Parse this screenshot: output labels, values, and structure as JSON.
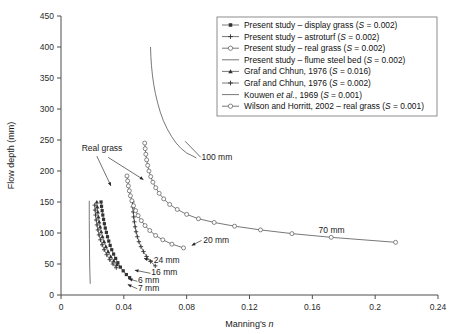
{
  "chart_data": {
    "type": "line",
    "title": "",
    "xlabel": "Manning's n",
    "ylabel": "Flow depth (mm)",
    "xlim": [
      0,
      0.24
    ],
    "ylim": [
      0,
      450
    ],
    "xticks": [
      "0",
      "0.04",
      "0.08",
      "0.12",
      "0.16",
      "0.2",
      "0.24"
    ],
    "xtick_values": [
      0,
      0.04,
      0.08,
      0.12,
      0.16,
      0.2,
      0.24
    ],
    "yticks": [
      "0",
      "50",
      "100",
      "150",
      "200",
      "250",
      "300",
      "350",
      "400",
      "450"
    ],
    "ytick_values": [
      0,
      50,
      100,
      150,
      200,
      250,
      300,
      350,
      400,
      450
    ],
    "grid": false,
    "legend_position": "top-right",
    "series": [
      {
        "name": "Present study – display grass (S = 0.002)",
        "marker": "filled-square",
        "label_key": "display-grass",
        "points": [
          [
            0.0255,
            150
          ],
          [
            0.0258,
            143
          ],
          [
            0.0262,
            136
          ],
          [
            0.0266,
            129
          ],
          [
            0.0271,
            122
          ],
          [
            0.0276,
            115
          ],
          [
            0.0282,
            108
          ],
          [
            0.0289,
            101
          ],
          [
            0.0296,
            94
          ],
          [
            0.0304,
            87
          ],
          [
            0.0313,
            80
          ],
          [
            0.0323,
            73
          ],
          [
            0.0335,
            66
          ],
          [
            0.0348,
            59
          ],
          [
            0.0362,
            52
          ],
          [
            0.0378,
            45
          ],
          [
            0.0396,
            39
          ],
          [
            0.0416,
            33
          ],
          [
            0.0437,
            28
          ]
        ]
      },
      {
        "name": "Present study – astroturf (S = 0.002)",
        "marker": "plus",
        "label_key": "astroturf",
        "points": [
          [
            0.0455,
            150
          ],
          [
            0.0457,
            142
          ],
          [
            0.046,
            134
          ],
          [
            0.0463,
            126
          ],
          [
            0.0467,
            118
          ],
          [
            0.0472,
            110
          ],
          [
            0.0478,
            102
          ],
          [
            0.0486,
            94
          ],
          [
            0.0496,
            86
          ],
          [
            0.0509,
            78
          ],
          [
            0.0525,
            70
          ],
          [
            0.0545,
            62
          ],
          [
            0.057,
            54
          ],
          [
            0.06,
            47
          ]
        ]
      },
      {
        "name": "Present study – real grass (S = 0.002)",
        "marker": "open-circle",
        "label_key": "real-grass-present",
        "points": [
          [
            0.042,
            192
          ],
          [
            0.0424,
            184
          ],
          [
            0.0429,
            176
          ],
          [
            0.0435,
            168
          ],
          [
            0.0442,
            160
          ],
          [
            0.0451,
            152
          ],
          [
            0.0462,
            144
          ],
          [
            0.0475,
            136
          ],
          [
            0.0491,
            128
          ],
          [
            0.0511,
            120
          ],
          [
            0.0535,
            112
          ],
          [
            0.0565,
            104
          ],
          [
            0.0602,
            96
          ],
          [
            0.0648,
            89
          ],
          [
            0.0706,
            82
          ],
          [
            0.078,
            76
          ]
        ]
      },
      {
        "name": "Present study – flume steel bed (S = 0.002)",
        "marker": "line",
        "label_key": "steel-bed-100mm",
        "points": [
          [
            0.057,
            400
          ],
          [
            0.0572,
            385
          ],
          [
            0.0576,
            370
          ],
          [
            0.0582,
            355
          ],
          [
            0.059,
            340
          ],
          [
            0.0601,
            325
          ],
          [
            0.0615,
            310
          ],
          [
            0.0632,
            295
          ],
          [
            0.0652,
            281
          ],
          [
            0.0676,
            268
          ],
          [
            0.0703,
            256
          ],
          [
            0.0733,
            245
          ],
          [
            0.0766,
            236
          ],
          [
            0.08,
            229
          ],
          [
            0.084,
            224
          ],
          [
            0.0862,
            221
          ]
        ]
      },
      {
        "name": "Graf and Chhun, 1976 (S = 0.016)",
        "marker": "filled-triangle",
        "label_key": "graf-0016",
        "points": [
          [
            0.0228,
            150
          ],
          [
            0.0231,
            142
          ],
          [
            0.0234,
            134
          ],
          [
            0.0238,
            126
          ],
          [
            0.0243,
            118
          ],
          [
            0.0249,
            110
          ],
          [
            0.0256,
            102
          ],
          [
            0.0264,
            94
          ],
          [
            0.0274,
            86
          ],
          [
            0.0286,
            78
          ],
          [
            0.03,
            70
          ],
          [
            0.0317,
            62
          ],
          [
            0.0336,
            55
          ],
          [
            0.0356,
            49
          ]
        ]
      },
      {
        "name": "Graf and Chhun, 1976 (S = 0.002)",
        "marker": "plus",
        "label_key": "graf-0002",
        "points": [
          [
            0.0215,
            145
          ],
          [
            0.0217,
            137
          ],
          [
            0.022,
            129
          ],
          [
            0.0224,
            121
          ],
          [
            0.0229,
            113
          ],
          [
            0.0235,
            105
          ],
          [
            0.0242,
            97
          ],
          [
            0.0251,
            89
          ],
          [
            0.0262,
            81
          ],
          [
            0.0275,
            73
          ],
          [
            0.0291,
            65
          ],
          [
            0.031,
            57
          ],
          [
            0.0331,
            50
          ],
          [
            0.0352,
            44
          ]
        ]
      },
      {
        "name": "Kouwen et al., 1969 (S = 0.001)",
        "marker": "line",
        "label_key": "kouwen",
        "points": [
          [
            0.018,
            152
          ],
          [
            0.018,
            120
          ],
          [
            0.0181,
            90
          ],
          [
            0.0182,
            60
          ],
          [
            0.0184,
            35
          ],
          [
            0.0186,
            18
          ]
        ]
      },
      {
        "name": "Wilson and Horritt, 2002 – real grass (S = 0.001)",
        "marker": "open-circle",
        "label_key": "wilson-horritt",
        "points": [
          [
            0.0533,
            245
          ],
          [
            0.0536,
            236
          ],
          [
            0.054,
            227
          ],
          [
            0.0545,
            218
          ],
          [
            0.0552,
            209
          ],
          [
            0.056,
            200
          ],
          [
            0.0571,
            191
          ],
          [
            0.0585,
            182
          ],
          [
            0.0603,
            173
          ],
          [
            0.0625,
            164
          ],
          [
            0.0654,
            155
          ],
          [
            0.0692,
            146
          ],
          [
            0.074,
            138
          ],
          [
            0.08,
            130
          ],
          [
            0.0875,
            123
          ],
          [
            0.0975,
            117
          ],
          [
            0.1105,
            111
          ],
          [
            0.127,
            105
          ],
          [
            0.147,
            99
          ],
          [
            0.172,
            93
          ],
          [
            0.213,
            85
          ]
        ]
      }
    ],
    "annotations": [
      {
        "text": "Real grass",
        "x": 0.0132,
        "y": 232
      },
      {
        "text": "100 mm",
        "x": 0.0895,
        "y": 218
      },
      {
        "text": "20 mm",
        "x": 0.0905,
        "y": 84
      },
      {
        "text": "70 mm",
        "x": 0.164,
        "y": 100
      },
      {
        "text": "24 mm",
        "x": 0.059,
        "y": 52
      },
      {
        "text": "16 mm",
        "x": 0.0575,
        "y": 32
      },
      {
        "text": "6 mm",
        "x": 0.049,
        "y": 19
      },
      {
        "text": "7 mm",
        "x": 0.049,
        "y": 7
      }
    ],
    "legend_entries": [
      {
        "label": "Present study – display grass (S = 0.002)",
        "marker": "filled-square"
      },
      {
        "label": "Present study – astroturf (S = 0.002)",
        "marker": "plus"
      },
      {
        "label": "Present study – real grass (S = 0.002)",
        "marker": "open-circle"
      },
      {
        "label": "Present study – flume steel bed (S = 0.002)",
        "marker": "line"
      },
      {
        "label": "Graf and Chhun, 1976 (S = 0.016)",
        "marker": "filled-triangle"
      },
      {
        "label": "Graf and Chhun, 1976 (S = 0.002)",
        "marker": "plus"
      },
      {
        "label": "Kouwen et al., 1969 (S = 0.001)",
        "marker": "line"
      },
      {
        "label": "Wilson and Horritt, 2002 – real grass (S = 0.001)",
        "marker": "open-circle"
      }
    ],
    "colors": {
      "line": "#555555",
      "axis": "#4d4d4d",
      "text": "#1a1a1a",
      "legend_border": "#808080",
      "background": "#ffffff"
    }
  }
}
